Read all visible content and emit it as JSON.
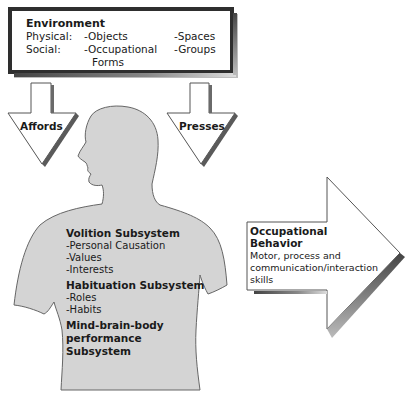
{
  "environment": {
    "title": "Environment",
    "rows": [
      {
        "label": "Physical:",
        "col1": "-Objects",
        "col2": "-Spaces"
      },
      {
        "label": "Social:",
        "col1": "-Occupational",
        "col1_cont": "Forms",
        "col2": "-Groups"
      }
    ]
  },
  "arrows": {
    "affords": "Affords",
    "presses": "Presses"
  },
  "person": {
    "volition": {
      "title": "Volition Subsystem",
      "items": [
        "-Personal Causation",
        "-Values",
        "-Interests"
      ]
    },
    "habituation": {
      "title": "Habituation Subsystem",
      "items": [
        "-Roles",
        "-Habits"
      ]
    },
    "performance": {
      "title_lines": [
        "Mind-brain-body",
        "performance",
        "Subsystem"
      ]
    }
  },
  "output": {
    "title_lines": [
      "Occupational",
      "Behavior"
    ],
    "description": "Motor, process and communication/interaction skills"
  },
  "colors": {
    "body_fill": "#d4d4d4",
    "outline": "#555555",
    "shadow": "#6a6a6a",
    "box_border": "#333333"
  }
}
